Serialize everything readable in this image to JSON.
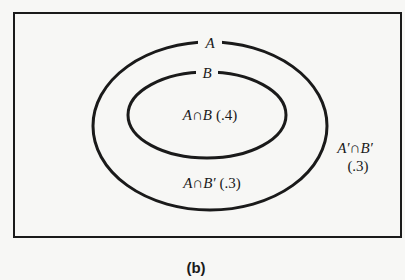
{
  "diagram": {
    "type": "venn",
    "caption": "(b)",
    "universe": {
      "label": ""
    },
    "sets": [
      {
        "name": "A",
        "label": "A"
      },
      {
        "name": "B",
        "label": "B",
        "subset_of": "A"
      }
    ],
    "regions": [
      {
        "id": "a_and_b",
        "set_expr": "A∩B",
        "prob": "(.4)"
      },
      {
        "id": "a_and_not_b",
        "set_expr": "A∩B′",
        "prob": "(.3)"
      },
      {
        "id": "not_a_and_not_b",
        "set_expr": "A′∩B′",
        "prob": "(.3)"
      }
    ],
    "colors": {
      "stroke": "#1a1a1a",
      "background": "#f7f7f5"
    }
  }
}
